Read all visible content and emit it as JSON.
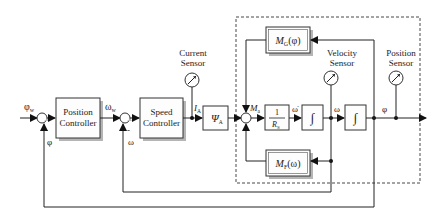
{
  "diagram": {
    "type": "control-block-diagram",
    "blocks": {
      "position_controller": {
        "line1": "Position",
        "line2": "Controller"
      },
      "speed_controller": {
        "line1": "Speed",
        "line2": "Controller"
      },
      "psi_a": {
        "main": "Ψ",
        "sub": "A"
      },
      "inv_rs": {
        "num": "1",
        "den_main": "R",
        "den_sub": "S"
      },
      "integrator1": {
        "symbol": "∫"
      },
      "integrator2": {
        "symbol": "∫"
      },
      "mg": {
        "main": "M",
        "sub": "G",
        "arg": "(φ)"
      },
      "mf": {
        "main": "M",
        "sub": "F",
        "arg": "(ω)"
      }
    },
    "sensors": {
      "current": {
        "line1": "Current",
        "line2": "Sensor"
      },
      "velocity": {
        "line1": "Velocity",
        "line2": "Sensor"
      },
      "position": {
        "line1": "Position",
        "line2": "Sensor"
      }
    },
    "signals": {
      "phi_w": {
        "main": "φ",
        "sub": "w"
      },
      "phi_fb": "φ",
      "omega_w": {
        "main": "ω",
        "sub": "w"
      },
      "omega_fb": "ω",
      "i_a": {
        "main": "I",
        "sub": "A"
      },
      "m_a": {
        "main": "M",
        "sub": "a"
      },
      "omega_dot": "ω̇",
      "omega": "ω",
      "phi": "φ",
      "minus1": "-",
      "minus2": "-"
    }
  }
}
